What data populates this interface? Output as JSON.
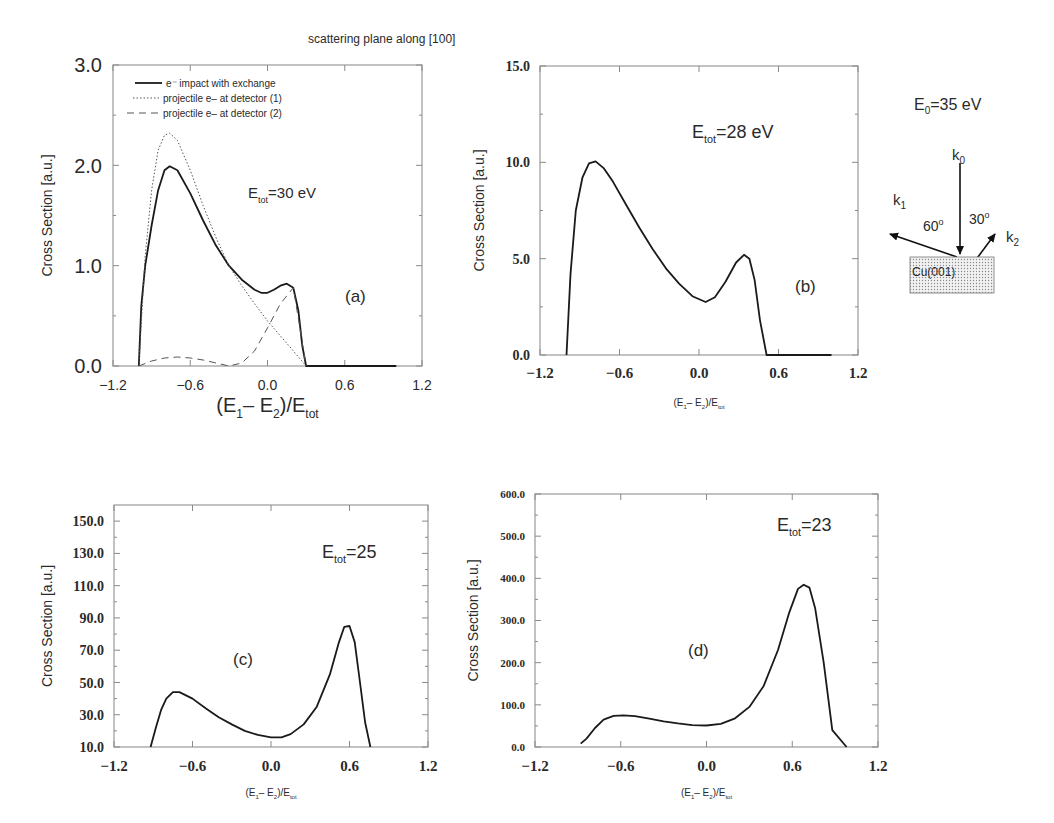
{
  "figure": {
    "title": "scattering plane along [100]"
  },
  "diagram": {
    "energy_label": "E",
    "energy_sub": "0",
    "energy_value": "=35 eV",
    "k0": "k",
    "k0_sub": "0",
    "k1": "k",
    "k1_sub": "1",
    "k2": "k",
    "k2_sub": "2",
    "angle1": "60",
    "angle2": "30",
    "deg": "o",
    "surface": "Cu(001)"
  },
  "chart_data": [
    {
      "id": "a",
      "type": "line",
      "panel_label": "(a)",
      "annotation": {
        "main": "E",
        "sub": "tot",
        "rest": "=30 eV"
      },
      "xlabel": {
        "pre": "(E",
        "s1": "1",
        "mid": "– E",
        "s2": "2",
        "post": ")/E",
        "s3": "tot"
      },
      "ylabel": "Cross Section [a.u.]",
      "xlim": [
        -1.2,
        1.2
      ],
      "ylim": [
        0.0,
        3.0
      ],
      "xticks": [
        "-1.2",
        "-0.6",
        "0.0",
        "0.6",
        "1.2"
      ],
      "yticks": [
        "0.0",
        "1.0",
        "2.0",
        "3.0"
      ],
      "legend": [
        {
          "style": "solid",
          "label": "e⁻ impact with exchange"
        },
        {
          "style": "dotted",
          "label": "projectile e– at detector (1)"
        },
        {
          "style": "dashed",
          "label": "projectile e– at detector (2)"
        }
      ],
      "series": [
        {
          "name": "e⁻ impact with exchange",
          "style": "solid",
          "x": [
            -1.0,
            -0.98,
            -0.95,
            -0.9,
            -0.85,
            -0.8,
            -0.76,
            -0.7,
            -0.6,
            -0.5,
            -0.4,
            -0.3,
            -0.2,
            -0.1,
            -0.05,
            0.0,
            0.05,
            0.1,
            0.15,
            0.2,
            0.24,
            0.27,
            0.3,
            1.0
          ],
          "y": [
            0.0,
            0.6,
            1.0,
            1.4,
            1.75,
            1.95,
            1.99,
            1.95,
            1.72,
            1.45,
            1.2,
            1.0,
            0.86,
            0.76,
            0.73,
            0.73,
            0.76,
            0.8,
            0.82,
            0.78,
            0.55,
            0.2,
            0.0,
            0.0
          ]
        },
        {
          "name": "projectile e– at detector (1)",
          "style": "dotted",
          "x": [
            -1.0,
            -0.95,
            -0.9,
            -0.85,
            -0.8,
            -0.76,
            -0.7,
            -0.6,
            -0.5,
            -0.4,
            -0.3,
            -0.2,
            -0.1,
            0.0,
            0.1,
            0.2,
            0.3
          ],
          "y": [
            0.0,
            1.1,
            1.75,
            2.15,
            2.3,
            2.32,
            2.25,
            1.95,
            1.6,
            1.28,
            1.0,
            0.8,
            0.62,
            0.45,
            0.3,
            0.15,
            0.0
          ]
        },
        {
          "name": "projectile e– at detector (2)",
          "style": "dashed",
          "x": [
            -1.0,
            -0.9,
            -0.8,
            -0.7,
            -0.6,
            -0.5,
            -0.4,
            -0.3,
            -0.2,
            -0.1,
            0.0,
            0.1,
            0.2,
            0.3
          ],
          "y": [
            0.0,
            0.05,
            0.08,
            0.09,
            0.08,
            0.06,
            0.03,
            0.0,
            0.03,
            0.15,
            0.38,
            0.62,
            0.78,
            0.0
          ]
        }
      ]
    },
    {
      "id": "b",
      "type": "line",
      "panel_label": "(b)",
      "annotation": {
        "main": "E",
        "sub": "tot",
        "rest": "=28 eV"
      },
      "xlabel": {
        "pre": "(E",
        "s1": "1",
        "mid": "– E",
        "s2": "2",
        "post": ")/E",
        "s3": "tot"
      },
      "ylabel": "Cross Section [a.u.]",
      "xlim": [
        -1.2,
        1.2
      ],
      "ylim": [
        0.0,
        15.0
      ],
      "xticks": [
        "-1.2",
        "-0.6",
        "0.0",
        "0.6",
        "1.2"
      ],
      "yticks": [
        "0.0",
        "5.0",
        "10.0",
        "15.0"
      ],
      "series": [
        {
          "name": "cross section",
          "style": "solid",
          "x": [
            -1.0,
            -0.97,
            -0.93,
            -0.88,
            -0.83,
            -0.78,
            -0.72,
            -0.65,
            -0.55,
            -0.45,
            -0.35,
            -0.25,
            -0.15,
            -0.05,
            0.05,
            0.12,
            0.2,
            0.28,
            0.34,
            0.38,
            0.42,
            0.46,
            0.51,
            1.0
          ],
          "y": [
            0.0,
            4.2,
            7.5,
            9.2,
            9.95,
            10.05,
            9.7,
            9.0,
            7.8,
            6.6,
            5.5,
            4.5,
            3.7,
            3.05,
            2.75,
            3.0,
            3.8,
            4.8,
            5.2,
            5.0,
            3.9,
            1.8,
            0.0,
            0.0
          ]
        }
      ]
    },
    {
      "id": "c",
      "type": "line",
      "panel_label": "(c)",
      "annotation": {
        "main": "E",
        "sub": "tot",
        "rest": "=25"
      },
      "xlabel": {
        "pre": "(E",
        "s1": "1",
        "mid": "– E",
        "s2": "2",
        "post": ")/E",
        "s3": "tot"
      },
      "ylabel": "Cross Section [a.u.]",
      "xlim": [
        -1.2,
        1.2
      ],
      "ylim": [
        10.0,
        160.0
      ],
      "xticks": [
        "-1.2",
        "-0.6",
        "0.0",
        "0.6",
        "1.2"
      ],
      "yticks": [
        "10.0",
        "30.0",
        "50.0",
        "70.0",
        "90.0",
        "110.0",
        "130.0",
        "150.0"
      ],
      "series": [
        {
          "name": "cross section",
          "style": "solid",
          "x": [
            -0.92,
            -0.88,
            -0.84,
            -0.8,
            -0.75,
            -0.7,
            -0.6,
            -0.5,
            -0.4,
            -0.3,
            -0.2,
            -0.1,
            0.0,
            0.08,
            0.15,
            0.25,
            0.35,
            0.45,
            0.52,
            0.56,
            0.6,
            0.64,
            0.68,
            0.72,
            0.76
          ],
          "y": [
            10.0,
            22.0,
            33.0,
            40.0,
            44.0,
            44.0,
            40.0,
            34.0,
            28.5,
            24.0,
            20.0,
            17.5,
            16.0,
            16.0,
            18.0,
            24.0,
            35.0,
            55.0,
            75.0,
            84.5,
            85.0,
            75.0,
            50.0,
            25.0,
            10.0
          ]
        }
      ]
    },
    {
      "id": "d",
      "type": "line",
      "panel_label": "(d)",
      "annotation": {
        "main": "E",
        "sub": "tot",
        "rest": "=23"
      },
      "xlabel": {
        "pre": "(E",
        "s1": "1",
        "mid": "– E",
        "s2": "2",
        "post": ")/E",
        "s3": "tot"
      },
      "ylabel": "Cross Section [a.u.]",
      "xlim": [
        -1.2,
        1.2
      ],
      "ylim": [
        0.0,
        600.0
      ],
      "xticks": [
        "-1.2",
        "-0.6",
        "0.0",
        "0.6",
        "1.2"
      ],
      "yticks": [
        "0.0",
        "100.0",
        "200.0",
        "300.0",
        "400.0",
        "500.0",
        "600.0"
      ],
      "series": [
        {
          "name": "cross section",
          "style": "solid",
          "x": [
            -0.88,
            -0.84,
            -0.78,
            -0.72,
            -0.65,
            -0.58,
            -0.5,
            -0.4,
            -0.3,
            -0.2,
            -0.1,
            0.0,
            0.1,
            0.2,
            0.3,
            0.4,
            0.5,
            0.58,
            0.64,
            0.68,
            0.72,
            0.76,
            0.82,
            0.88,
            0.98
          ],
          "y": [
            8.0,
            20.0,
            45.0,
            65.0,
            74.0,
            75.0,
            73.0,
            67.0,
            61.0,
            56.0,
            52.0,
            51.0,
            55.0,
            68.0,
            95.0,
            145.0,
            230.0,
            320.0,
            375.0,
            385.0,
            378.0,
            330.0,
            200.0,
            40.0,
            0.0
          ]
        }
      ]
    }
  ]
}
